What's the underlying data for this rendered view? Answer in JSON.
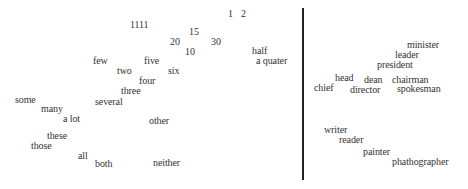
{
  "left_panel": {
    "words": [
      {
        "text": "1",
        "x": 228,
        "y": 9
      },
      {
        "text": "2",
        "x": 241,
        "y": 9
      },
      {
        "text": "1111",
        "x": 130,
        "y": 20
      },
      {
        "text": "15",
        "x": 189,
        "y": 27
      },
      {
        "text": "20",
        "x": 170,
        "y": 37
      },
      {
        "text": "30",
        "x": 211,
        "y": 37
      },
      {
        "text": "10",
        "x": 185,
        "y": 47
      },
      {
        "text": "half",
        "x": 252,
        "y": 46
      },
      {
        "text": "a quater",
        "x": 256,
        "y": 56
      },
      {
        "text": "few",
        "x": 93,
        "y": 56
      },
      {
        "text": "five",
        "x": 144,
        "y": 56
      },
      {
        "text": "two",
        "x": 117,
        "y": 66
      },
      {
        "text": "six",
        "x": 168,
        "y": 66
      },
      {
        "text": "four",
        "x": 139,
        "y": 76
      },
      {
        "text": "three",
        "x": 121,
        "y": 86
      },
      {
        "text": "some",
        "x": 15,
        "y": 95
      },
      {
        "text": "several",
        "x": 95,
        "y": 97
      },
      {
        "text": "many",
        "x": 41,
        "y": 104
      },
      {
        "text": "a lot",
        "x": 63,
        "y": 114
      },
      {
        "text": "other",
        "x": 149,
        "y": 116
      },
      {
        "text": "these",
        "x": 47,
        "y": 131
      },
      {
        "text": "those",
        "x": 31,
        "y": 141
      },
      {
        "text": "all",
        "x": 78,
        "y": 151
      },
      {
        "text": "both",
        "x": 95,
        "y": 159
      },
      {
        "text": "neither",
        "x": 153,
        "y": 158
      }
    ]
  },
  "right_panel": {
    "words": [
      {
        "text": "minister",
        "x": 407,
        "y": 40
      },
      {
        "text": "leader",
        "x": 395,
        "y": 50
      },
      {
        "text": "president",
        "x": 377,
        "y": 60
      },
      {
        "text": "head",
        "x": 335,
        "y": 73
      },
      {
        "text": "dean",
        "x": 364,
        "y": 75
      },
      {
        "text": "chairman",
        "x": 392,
        "y": 75
      },
      {
        "text": "chief",
        "x": 314,
        "y": 83
      },
      {
        "text": "director",
        "x": 350,
        "y": 85
      },
      {
        "text": "spokesman",
        "x": 397,
        "y": 84
      },
      {
        "text": "writer",
        "x": 324,
        "y": 125
      },
      {
        "text": "reader",
        "x": 339,
        "y": 135
      },
      {
        "text": "painter",
        "x": 363,
        "y": 147
      },
      {
        "text": "phathographer",
        "x": 392,
        "y": 157
      }
    ]
  },
  "divider": {
    "color": "#222222"
  }
}
